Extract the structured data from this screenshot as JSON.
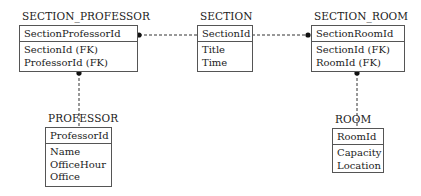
{
  "diagram": {
    "type": "er-diagram",
    "entities": {
      "section_professor": {
        "name": "SECTION_PROFESSOR",
        "primary_key": "SectionProfessorId",
        "attributes": [
          "SectionId (FK)",
          "ProfessorId (FK)"
        ]
      },
      "section": {
        "name": "SECTION",
        "primary_key": "SectionId",
        "attributes": [
          "Title",
          "Time"
        ]
      },
      "section_room": {
        "name": "SECTION_ROOM",
        "primary_key": "SectionRoomId",
        "attributes": [
          "SectionId (FK)",
          "RoomId (FK)"
        ]
      },
      "professor": {
        "name": "PROFESSOR",
        "primary_key": "ProfessorId",
        "attributes": [
          "Name",
          "OfficeHour",
          "Office"
        ]
      },
      "room": {
        "name": "ROOM",
        "primary_key": "RoomId",
        "attributes": [
          "Capacity",
          "Location"
        ]
      }
    },
    "relationships": [
      {
        "from": "SECTION",
        "to": "SECTION_PROFESSOR",
        "style": "dashed",
        "many_end": "SECTION_PROFESSOR"
      },
      {
        "from": "SECTION",
        "to": "SECTION_ROOM",
        "style": "dashed",
        "many_end": "SECTION_ROOM"
      },
      {
        "from": "PROFESSOR",
        "to": "SECTION_PROFESSOR",
        "style": "dashed",
        "many_end": "SECTION_PROFESSOR"
      },
      {
        "from": "ROOM",
        "to": "SECTION_ROOM",
        "style": "dashed",
        "many_end": "SECTION_ROOM"
      }
    ]
  }
}
